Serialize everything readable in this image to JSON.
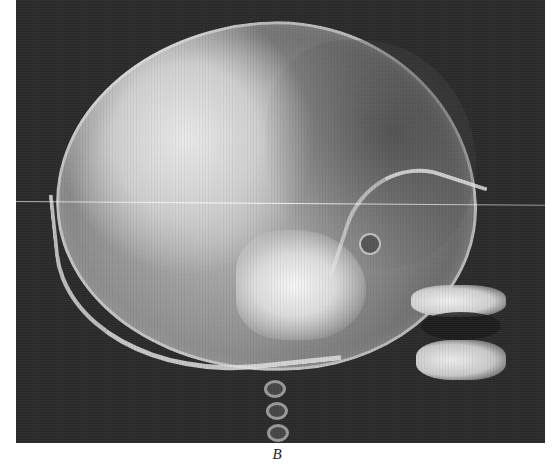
{
  "figure": {
    "caption_label": "B",
    "colors": {
      "background": "#2a2a2a",
      "bone_highlight": "#e9e9e9",
      "page": "#ffffff"
    }
  }
}
